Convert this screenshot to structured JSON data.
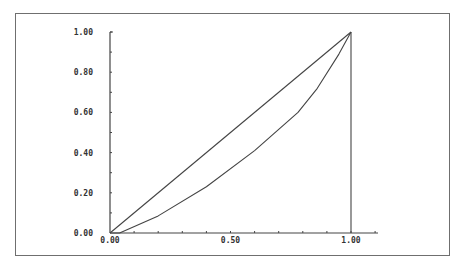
{
  "chart_data": {
    "type": "line",
    "title": "",
    "xlabel": "",
    "ylabel": "",
    "xlim": [
      0,
      1
    ],
    "ylim": [
      0,
      1
    ],
    "grid": false,
    "legend": null,
    "x_ticks": [
      {
        "value": 0,
        "label": "0.00"
      },
      {
        "value": 0.5,
        "label": "0.50"
      },
      {
        "value": 1,
        "label": "1.00"
      }
    ],
    "y_ticks": [
      {
        "value": 0,
        "label": "0.00"
      },
      {
        "value": 0.2,
        "label": "0.20"
      },
      {
        "value": 0.4,
        "label": "0.40"
      },
      {
        "value": 0.6,
        "label": "0.60"
      },
      {
        "value": 0.8,
        "label": "0.80"
      },
      {
        "value": 1.0,
        "label": "1.00"
      }
    ],
    "series": [
      {
        "name": "line-of-equality",
        "x": [
          0,
          1
        ],
        "y": [
          0,
          1
        ]
      },
      {
        "name": "lorenz-curve",
        "x": [
          0,
          0.04,
          0.2,
          0.4,
          0.6,
          0.78,
          0.86,
          0.95,
          1.0
        ],
        "y": [
          0,
          0.0,
          0.085,
          0.23,
          0.41,
          0.6,
          0.72,
          0.89,
          1.0
        ]
      },
      {
        "name": "vertical-at-x1",
        "x": [
          1,
          1
        ],
        "y": [
          0,
          1
        ]
      }
    ]
  },
  "colors": {
    "line": "#444444",
    "frame": "#6f6f6f",
    "axis": "#444444",
    "text": "#333333"
  }
}
